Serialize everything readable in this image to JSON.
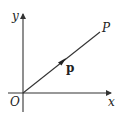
{
  "diagram": {
    "type": "vector-diagram",
    "colors": {
      "line": "#333333",
      "text": "#222222",
      "background": "#ffffff"
    },
    "axes": {
      "x_label": "x",
      "y_label": "y",
      "origin_label": "O"
    },
    "point": {
      "label": "P"
    },
    "vector": {
      "label": "p",
      "from": "O",
      "to": "P"
    }
  }
}
